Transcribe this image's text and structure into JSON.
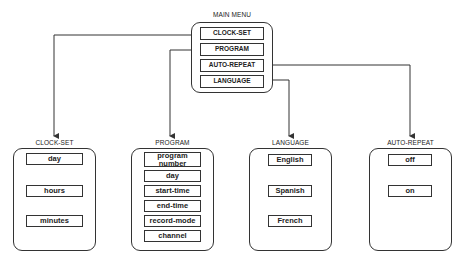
{
  "main_menu": {
    "title": "MAIN MENU",
    "items": [
      {
        "label": "CLOCK-SET"
      },
      {
        "label": "PROGRAM"
      },
      {
        "label": "AUTO-REPEAT"
      },
      {
        "label": "LANGUAGE"
      }
    ]
  },
  "submenus": {
    "clock_set": {
      "title": "CLOCK-SET",
      "items": [
        {
          "label": "day"
        },
        {
          "label": "hours"
        },
        {
          "label": "minutes"
        }
      ]
    },
    "program": {
      "title": "PROGRAM",
      "items": [
        {
          "label": "program number"
        },
        {
          "label": "day"
        },
        {
          "label": "start-time"
        },
        {
          "label": "end-time"
        },
        {
          "label": "record-mode"
        },
        {
          "label": "channel"
        }
      ]
    },
    "language": {
      "title": "LANGUAGE",
      "items": [
        {
          "label": "English"
        },
        {
          "label": "Spanish"
        },
        {
          "label": "French"
        }
      ]
    },
    "auto_repeat": {
      "title": "AUTO-REPEAT",
      "items": [
        {
          "label": "off"
        },
        {
          "label": "on"
        }
      ]
    }
  },
  "connections": [
    {
      "from": "CLOCK-SET",
      "to": "CLOCK-SET panel"
    },
    {
      "from": "PROGRAM",
      "to": "PROGRAM panel"
    },
    {
      "from": "AUTO-REPEAT",
      "to": "AUTO-REPEAT panel"
    },
    {
      "from": "LANGUAGE",
      "to": "LANGUAGE panel"
    }
  ]
}
